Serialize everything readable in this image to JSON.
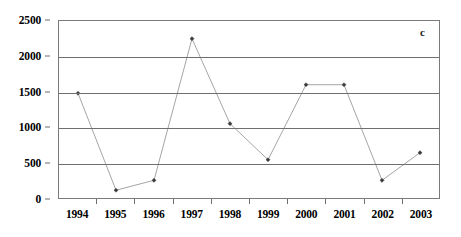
{
  "chart_data": {
    "type": "line",
    "title": "",
    "subtitle": "",
    "panel_label": "c",
    "xlabel": "",
    "ylabel": "",
    "categories": [
      "1994",
      "1995",
      "1996",
      "1997",
      "1998",
      "1999",
      "2000",
      "2001",
      "2002",
      "2003"
    ],
    "values": [
      1480,
      110,
      250,
      2250,
      1050,
      540,
      1600,
      1600,
      250,
      640
    ],
    "series": [
      {
        "name": "",
        "values": [
          1480,
          110,
          250,
          2250,
          1050,
          540,
          1600,
          1600,
          250,
          640
        ]
      }
    ],
    "ylim": [
      0,
      2500
    ],
    "y_ticks": [
      0,
      500,
      1000,
      1500,
      2000,
      2500
    ],
    "y_tick_labels": [
      "0",
      "500",
      "1000",
      "1500",
      "2000",
      "2500"
    ],
    "x_tick_labels": [
      "1994",
      "1995",
      "1996",
      "1997",
      "1998",
      "1999",
      "2000",
      "2001",
      "2002",
      "2003"
    ],
    "grid": true,
    "grid_axis": "y",
    "legend": false,
    "legend_position": "none",
    "marker": "diamond",
    "line_color": "#9a9a9a",
    "marker_color": "#3b3b3b",
    "axis_color": "#6f6f6f"
  }
}
